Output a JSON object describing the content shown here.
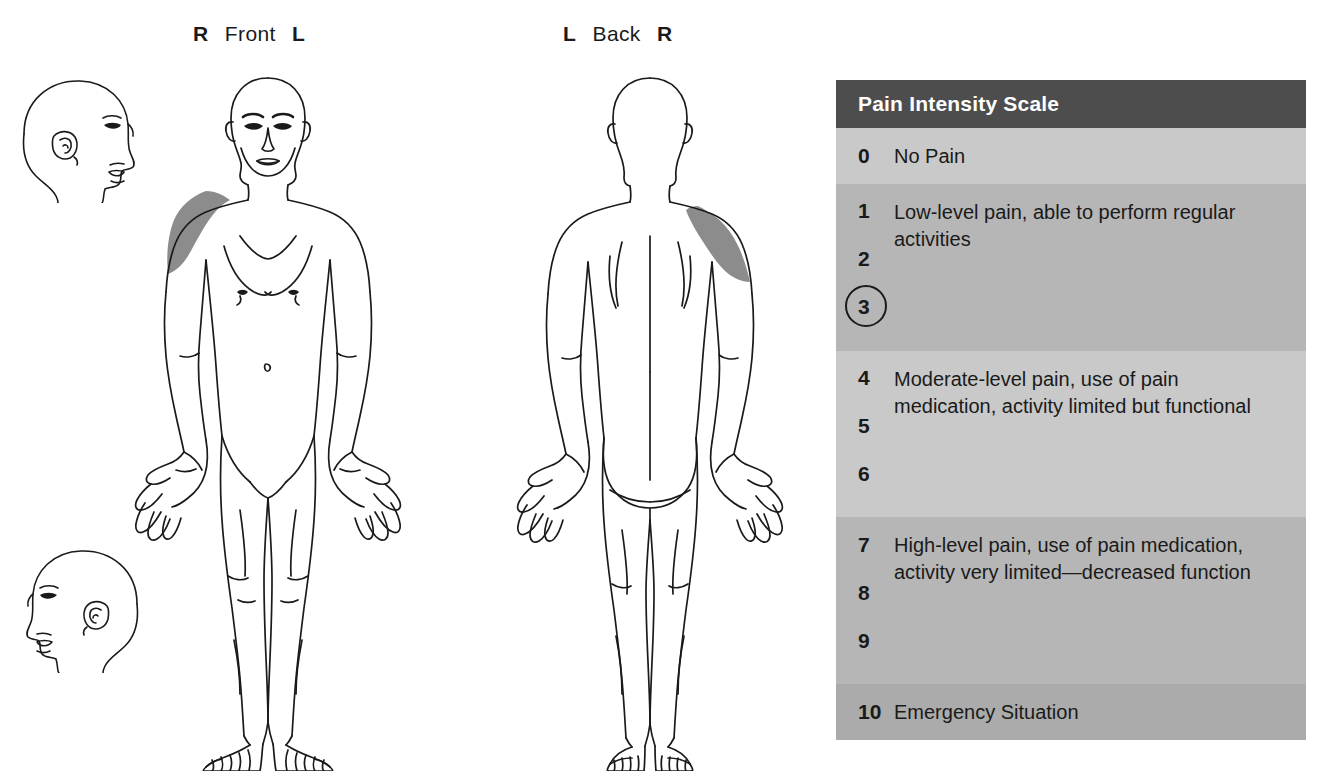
{
  "top_caption": "",
  "views": {
    "front": {
      "left_marker": "R",
      "name": "Front",
      "right_marker": "L"
    },
    "back": {
      "left_marker": "L",
      "name": "Back",
      "right_marker": "R"
    }
  },
  "figures": {
    "head_profile_top": "head-profile-facing-right",
    "head_profile_bottom": "head-profile-facing-left",
    "front_body": "anterior-body-outline",
    "back_body": "posterior-body-outline"
  },
  "pain_markings": [
    {
      "view": "front",
      "region": "right-shoulder-deltoid",
      "side_label": "R",
      "shade_color": "#8c8c8c"
    },
    {
      "view": "back",
      "region": "right-shoulder-deltoid",
      "side_label": "R",
      "shade_color": "#8c8c8c"
    }
  ],
  "scale": {
    "title": "Pain Intensity Scale",
    "selected_value": "3",
    "header_bg": "#4d4d4d",
    "header_text_color": "#ffffff",
    "groups": [
      {
        "numbers": [
          "0"
        ],
        "description": "No Pain",
        "band": "band-a",
        "single_line": true
      },
      {
        "numbers": [
          "1",
          "2",
          "3"
        ],
        "description": "Low-level pain, able to perform regular activities",
        "band": "band-b",
        "single_line": false
      },
      {
        "numbers": [
          "4",
          "5",
          "6"
        ],
        "description": "Moderate-level pain, use of pain medication, activity limited but functional",
        "band": "band-a",
        "single_line": false
      },
      {
        "numbers": [
          "7",
          "8",
          "9"
        ],
        "description": "High-level pain, use of pain medication, activity very limited—decreased function",
        "band": "band-b",
        "single_line": false
      },
      {
        "numbers": [
          "10"
        ],
        "description": "Emergency Situation",
        "band": "band-c",
        "single_line": true
      }
    ]
  }
}
